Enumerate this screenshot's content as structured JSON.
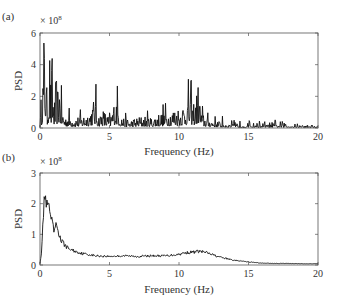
{
  "figure": {
    "panels": [
      {
        "id": "a",
        "panel_label": "(a)",
        "exponent_label": "× 10",
        "exponent_power": "8",
        "ylabel": "PSD",
        "xlabel": "Frequency (Hz)",
        "yticks": [
          "0",
          "2",
          "4",
          "6"
        ],
        "xticks": [
          "0",
          "5",
          "10",
          "15",
          "20"
        ]
      },
      {
        "id": "b",
        "panel_label": "(b)",
        "exponent_label": "× 10",
        "exponent_power": "8",
        "ylabel": "PSD",
        "xlabel": "Frequency (Hz)",
        "yticks": [
          "0",
          "1",
          "2",
          "3"
        ],
        "xticks": [
          "0",
          "5",
          "10",
          "15",
          "20"
        ]
      }
    ]
  },
  "chart_data": [
    {
      "type": "line",
      "title": "(a)",
      "xlabel": "Frequency (Hz)",
      "ylabel": "PSD",
      "y_scale_factor": "1e8",
      "xlim": [
        0,
        20
      ],
      "ylim": [
        0,
        6
      ],
      "grid": false,
      "legend": null,
      "series": [
        {
          "name": "PSD (raw periodogram)",
          "x": [
            0.0,
            0.1,
            0.2,
            0.3,
            0.4,
            0.5,
            0.6,
            0.7,
            0.8,
            0.9,
            1.0,
            1.2,
            1.4,
            1.6,
            1.8,
            2.0,
            2.5,
            3.0,
            3.5,
            4.0,
            4.2,
            4.5,
            5.0,
            5.5,
            5.8,
            6.0,
            6.5,
            7.0,
            7.5,
            8.0,
            8.5,
            9.0,
            9.5,
            10.0,
            10.5,
            10.8,
            11.0,
            11.2,
            11.4,
            11.6,
            12.0,
            12.5,
            13.0,
            14.0,
            15.0,
            16.0,
            17.0,
            18.0,
            19.0,
            20.0
          ],
          "y": [
            0.3,
            1.2,
            2.5,
            4.8,
            3.7,
            1.0,
            2.2,
            3.8,
            1.5,
            2.6,
            1.2,
            1.6,
            2.3,
            0.9,
            0.6,
            0.7,
            0.5,
            0.6,
            0.8,
            1.5,
            0.6,
            0.9,
            0.5,
            1.6,
            0.7,
            0.5,
            0.4,
            0.5,
            0.6,
            0.5,
            0.7,
            0.8,
            0.9,
            1.0,
            1.3,
            1.7,
            1.2,
            1.4,
            2.1,
            0.8,
            0.5,
            0.4,
            0.3,
            0.2,
            0.2,
            0.2,
            0.2,
            0.2,
            0.15,
            0.1
          ]
        }
      ]
    },
    {
      "type": "line",
      "title": "(b)",
      "xlabel": "Frequency (Hz)",
      "ylabel": "PSD",
      "y_scale_factor": "1e8",
      "xlim": [
        0,
        20
      ],
      "ylim": [
        0,
        3
      ],
      "grid": false,
      "legend": null,
      "series": [
        {
          "name": "PSD (smoothed)",
          "x": [
            0.0,
            0.1,
            0.2,
            0.3,
            0.4,
            0.5,
            0.6,
            0.8,
            1.0,
            1.2,
            1.5,
            2.0,
            2.5,
            3.0,
            4.0,
            5.0,
            6.0,
            7.0,
            8.0,
            9.0,
            10.0,
            10.5,
            11.0,
            11.5,
            12.0,
            12.5,
            13.0,
            14.0,
            15.0,
            16.0,
            17.0,
            18.0,
            19.0,
            20.0
          ],
          "y": [
            0.05,
            0.4,
            1.2,
            2.2,
            2.1,
            1.9,
            1.95,
            1.5,
            1.1,
            1.3,
            0.8,
            0.55,
            0.45,
            0.38,
            0.3,
            0.28,
            0.3,
            0.28,
            0.3,
            0.3,
            0.35,
            0.4,
            0.42,
            0.45,
            0.4,
            0.32,
            0.25,
            0.15,
            0.1,
            0.06,
            0.05,
            0.05,
            0.04,
            0.04
          ]
        }
      ]
    }
  ]
}
